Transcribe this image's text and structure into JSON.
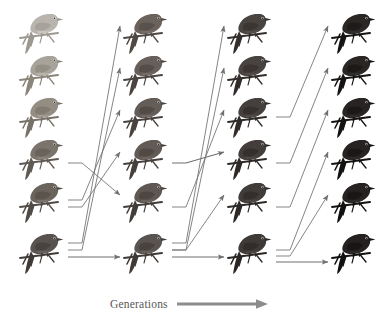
{
  "figure": {
    "caption": {
      "label": "Generations",
      "arrow_icon": "right-arrow-icon",
      "arrow_color": "#8c8c8c"
    },
    "background_color": "#ffffff",
    "columns": 4,
    "rows": 6,
    "column_x": [
      18,
      122,
      226,
      330
    ],
    "row_y": [
      6,
      48,
      90,
      132,
      175,
      226
    ],
    "bird_size": {
      "width": 46,
      "height": 52
    },
    "arrow_color": "#6f6f6f",
    "birds": [
      {
        "col": 0,
        "row": 0,
        "name": "bird-c1-r1",
        "shade": "#b9b5ae",
        "shade_dark": "#9c988f",
        "belly": "#cfcbc4"
      },
      {
        "col": 0,
        "row": 1,
        "name": "bird-c1-r2",
        "shade": "#a8a39a",
        "shade_dark": "#8b8579",
        "belly": "#bfbab2"
      },
      {
        "col": 0,
        "row": 2,
        "name": "bird-c1-r3",
        "shade": "#948d84",
        "shade_dark": "#787168",
        "belly": "#a9a29a"
      },
      {
        "col": 0,
        "row": 3,
        "name": "bird-c1-r4",
        "shade": "#7b746c",
        "shade_dark": "#605a53",
        "belly": "#8e8780"
      },
      {
        "col": 0,
        "row": 4,
        "name": "bird-c1-r5",
        "shade": "#6b645d",
        "shade_dark": "#514b45",
        "belly": "#7d766f"
      },
      {
        "col": 0,
        "row": 5,
        "name": "bird-c1-r6",
        "shade": "#595350",
        "shade_dark": "#3f3a37",
        "belly": "#6a6461"
      },
      {
        "col": 1,
        "row": 0,
        "name": "bird-c2-r1",
        "shade": "#6b625c",
        "shade_dark": "#4f4843",
        "belly": "#7b726c"
      },
      {
        "col": 1,
        "row": 1,
        "name": "bird-c2-r2",
        "shade": "#675f59",
        "shade_dark": "#4b4440",
        "belly": "#776f69"
      },
      {
        "col": 1,
        "row": 2,
        "name": "bird-c2-r3",
        "shade": "#645c57",
        "shade_dark": "#49423e",
        "belly": "#746c67"
      },
      {
        "col": 1,
        "row": 3,
        "name": "bird-c2-r4",
        "shade": "#615a55",
        "shade_dark": "#46403c",
        "belly": "#716a65"
      },
      {
        "col": 1,
        "row": 4,
        "name": "bird-c2-r5",
        "shade": "#5e5752",
        "shade_dark": "#433d39",
        "belly": "#6e6762"
      },
      {
        "col": 1,
        "row": 5,
        "name": "bird-c2-r6",
        "shade": "#5a5450",
        "shade_dark": "#403a37",
        "belly": "#6a6460"
      },
      {
        "col": 2,
        "row": 0,
        "name": "bird-c3-r1",
        "shade": "#4a4441",
        "shade_dark": "#332e2c",
        "belly": "#57514e"
      },
      {
        "col": 2,
        "row": 1,
        "name": "bird-c3-r2",
        "shade": "#484240",
        "shade_dark": "#322d2b",
        "belly": "#555050"
      },
      {
        "col": 2,
        "row": 2,
        "name": "bird-c3-r3",
        "shade": "#45403e",
        "shade_dark": "#2f2b29",
        "belly": "#524d4b"
      },
      {
        "col": 2,
        "row": 3,
        "name": "bird-c3-r4",
        "shade": "#433e3c",
        "shade_dark": "#2d2927",
        "belly": "#504b49"
      },
      {
        "col": 2,
        "row": 4,
        "name": "bird-c3-r5",
        "shade": "#413c3a",
        "shade_dark": "#2c2826",
        "belly": "#4e4947"
      },
      {
        "col": 2,
        "row": 5,
        "name": "bird-c3-r6",
        "shade": "#3f3a38",
        "shade_dark": "#2a2624",
        "belly": "#4c4745"
      },
      {
        "col": 3,
        "row": 0,
        "name": "bird-c4-r1",
        "shade": "#2b2725",
        "shade_dark": "#171514",
        "belly": "#363231"
      },
      {
        "col": 3,
        "row": 1,
        "name": "bird-c4-r2",
        "shade": "#2a2624",
        "shade_dark": "#161413",
        "belly": "#353130"
      },
      {
        "col": 3,
        "row": 2,
        "name": "bird-c4-r3",
        "shade": "#282423",
        "shade_dark": "#151312",
        "belly": "#332f2e"
      },
      {
        "col": 3,
        "row": 3,
        "name": "bird-c4-r4",
        "shade": "#272322",
        "shade_dark": "#141211",
        "belly": "#322e2d"
      },
      {
        "col": 3,
        "row": 4,
        "name": "bird-c4-r5",
        "shade": "#262221",
        "shade_dark": "#131110",
        "belly": "#312d2c"
      },
      {
        "col": 3,
        "row": 5,
        "name": "bird-c4-r6",
        "shade": "#252120",
        "shade_dark": "#121010",
        "belly": "#302c2b"
      }
    ],
    "arrows": [
      {
        "name": "arrow-g1-a",
        "gap": 0,
        "from_row": 5,
        "to_row": 0,
        "stub_y": 243,
        "tip_y": 26
      },
      {
        "name": "arrow-g1-b",
        "gap": 0,
        "from_row": 5,
        "to_row": 1,
        "stub_y": 250,
        "tip_y": 68
      },
      {
        "name": "arrow-g1-c",
        "gap": 0,
        "from_row": 4,
        "to_row": 2,
        "stub_y": 200,
        "tip_y": 110
      },
      {
        "name": "arrow-g1-d",
        "gap": 0,
        "from_row": 4,
        "to_row": 3,
        "stub_y": 207,
        "tip_y": 152
      },
      {
        "name": "arrow-g1-e",
        "gap": 0,
        "from_row": 3,
        "to_row": 4,
        "stub_y": 163,
        "tip_y": 195
      },
      {
        "name": "arrow-g1-f",
        "gap": 0,
        "from_row": 5,
        "to_row": 5,
        "stub_y": 257,
        "tip_y": 257
      },
      {
        "name": "arrow-g2-a",
        "gap": 1,
        "from_row": 5,
        "to_row": 0,
        "stub_y": 243,
        "tip_y": 26
      },
      {
        "name": "arrow-g2-b",
        "gap": 1,
        "from_row": 5,
        "to_row": 1,
        "stub_y": 250,
        "tip_y": 68
      },
      {
        "name": "arrow-g2-c",
        "gap": 1,
        "from_row": 4,
        "to_row": 2,
        "stub_y": 207,
        "tip_y": 110
      },
      {
        "name": "arrow-g2-d",
        "gap": 1,
        "from_row": 3,
        "to_row": 3,
        "stub_y": 163,
        "tip_y": 152
      },
      {
        "name": "arrow-g2-e",
        "gap": 1,
        "from_row": 5,
        "to_row": 4,
        "stub_y": 250,
        "tip_y": 195
      },
      {
        "name": "arrow-g2-f",
        "gap": 1,
        "from_row": 5,
        "to_row": 5,
        "stub_y": 257,
        "tip_y": 257
      },
      {
        "name": "arrow-g3-a",
        "gap": 2,
        "from_row": 2,
        "to_row": 0,
        "stub_y": 117,
        "tip_y": 26
      },
      {
        "name": "arrow-g3-b",
        "gap": 2,
        "from_row": 3,
        "to_row": 1,
        "stub_y": 163,
        "tip_y": 68
      },
      {
        "name": "arrow-g3-c",
        "gap": 2,
        "from_row": 4,
        "to_row": 2,
        "stub_y": 207,
        "tip_y": 110
      },
      {
        "name": "arrow-g3-d",
        "gap": 2,
        "from_row": 5,
        "to_row": 3,
        "stub_y": 250,
        "tip_y": 152
      },
      {
        "name": "arrow-g3-e",
        "gap": 2,
        "from_row": 5,
        "to_row": 4,
        "stub_y": 256,
        "tip_y": 195
      },
      {
        "name": "arrow-g3-f",
        "gap": 2,
        "from_row": 5,
        "to_row": 5,
        "stub_y": 262,
        "tip_y": 262
      }
    ]
  }
}
